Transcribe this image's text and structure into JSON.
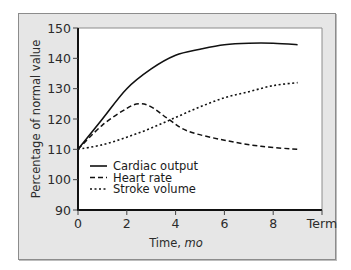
{
  "chart_data": {
    "type": "line",
    "title": "",
    "xlabel": "Time, mo",
    "xlabel_parts": {
      "main": "Time, ",
      "italic": "mo"
    },
    "ylabel": "Percentage of normal value",
    "xlim": [
      0,
      10
    ],
    "ylim": [
      90,
      150
    ],
    "x_ticks": [
      0,
      2,
      4,
      6,
      8,
      10
    ],
    "x_tick_labels": [
      "0",
      "2",
      "4",
      "6",
      "8",
      "Term"
    ],
    "y_ticks": [
      90,
      100,
      110,
      120,
      130,
      140,
      150
    ],
    "y_tick_labels": [
      "90",
      "100",
      "110",
      "120",
      "130",
      "140",
      "150"
    ],
    "grid": false,
    "legend_position": "lower-left inside plot",
    "series": [
      {
        "name": "Cardiac output",
        "style": "solid",
        "x": [
          0,
          1,
          2,
          3,
          4,
          5,
          6,
          7,
          8,
          9
        ],
        "values": [
          110,
          120,
          130,
          136.5,
          141,
          143,
          144.5,
          145,
          145,
          144.5
        ]
      },
      {
        "name": "Heart rate",
        "style": "dashed",
        "x": [
          0,
          1,
          2,
          2.5,
          3,
          3.7,
          4.5,
          6,
          7.5,
          9
        ],
        "values": [
          110,
          118,
          123.5,
          125,
          124,
          120,
          116,
          113,
          111,
          110
        ]
      },
      {
        "name": "Stroke volume",
        "style": "dotted",
        "x": [
          0,
          1,
          2,
          3,
          4,
          5,
          6,
          7,
          8,
          9
        ],
        "values": [
          110,
          111.5,
          114,
          117,
          120.5,
          124,
          127,
          129,
          131,
          132
        ]
      }
    ]
  },
  "colors": {
    "panel_background": "#e6e6e6",
    "plot_background": "#ffffff",
    "line": "#111111",
    "text": "#2b2b2b"
  }
}
